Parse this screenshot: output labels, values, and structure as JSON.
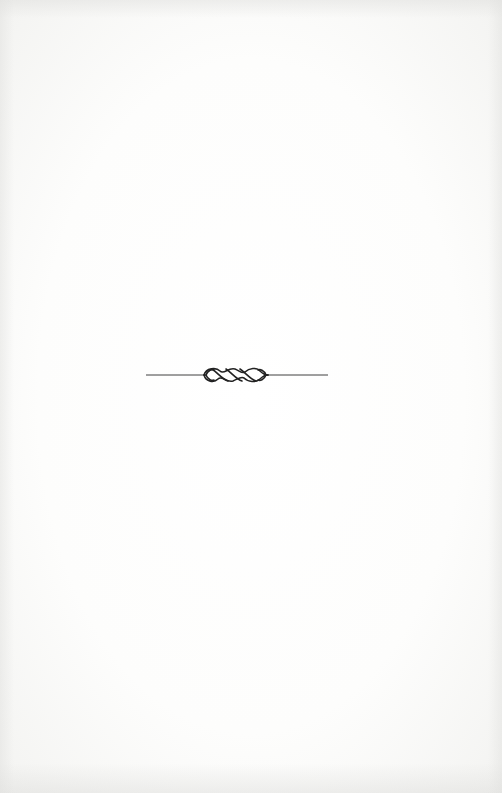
{
  "page": {
    "type": "blank-book-page",
    "background_color": "#fbfbfa"
  },
  "ornament": {
    "name": "twisted-rope-divider",
    "description": "horizontal rule with four-loop twisted knot in center",
    "stroke_color": "#2a2a2a",
    "loops": 4
  }
}
